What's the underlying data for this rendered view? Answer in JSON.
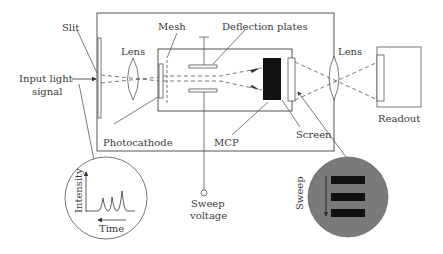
{
  "diagram": {
    "type": "streak-camera-schematic",
    "labels": {
      "slit": "Slit",
      "input_line1": "Input light",
      "input_line2": "signal",
      "lens_left": "Lens",
      "mesh": "Mesh",
      "deflection_plates": "Deflection plates",
      "lens_right": "Lens",
      "readout": "Readout",
      "photocathode": "Photocathode",
      "mcp": "MCP",
      "screen": "Screen",
      "sweep_voltage_line1": "Sweep",
      "sweep_voltage_line2": "voltage",
      "intensity": "Intensity",
      "time": "Time",
      "sweep": "Sweep"
    },
    "colors": {
      "line": "#555555",
      "mcp_fill": "#111111",
      "screen_circle_fill": "#7a7a7a",
      "streak_bar": "#111111"
    }
  }
}
